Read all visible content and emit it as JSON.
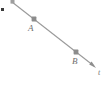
{
  "figure": {
    "type": "geometry-diagram",
    "background_color": "#ffffff",
    "line_color": "#9a9a9a",
    "marker_color": "#8c8c8c",
    "label_color": "#6e6e6e",
    "corner_dot_color": "#3a3a3a"
  },
  "axis": {
    "name": "t-axis",
    "label": "t",
    "label_position": {
      "x": 98,
      "y": 69
    },
    "start": {
      "x": 12,
      "y": 2
    },
    "end": {
      "x": 96,
      "y": 68
    },
    "has_arrowhead_at_end": true,
    "has_marker_at_start": true
  },
  "points": [
    {
      "id": "A",
      "label": "A",
      "marker": {
        "x": 34,
        "y": 19
      },
      "label_position": {
        "x": 28,
        "y": 24
      }
    },
    {
      "id": "B",
      "label": "B",
      "marker": {
        "x": 76,
        "y": 52
      },
      "label_position": {
        "x": 72,
        "y": 57
      }
    }
  ],
  "corner_dot": {
    "name": "corner-dot",
    "position": {
      "x": 1,
      "y": 8
    }
  }
}
